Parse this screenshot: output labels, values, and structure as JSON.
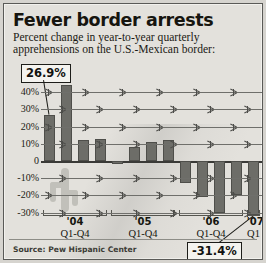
{
  "graphic": {
    "title": "Fewer border arrests",
    "subtitle": "Percent change in year-to-year quarterly apprehensions on the U.S.-Mexican border:",
    "source": "Source: Pew Hispanic Center"
  },
  "callouts": [
    {
      "id": "high",
      "label": "26.9%",
      "points_to_bar": 0
    },
    {
      "id": "low",
      "label": "-31.4%",
      "points_to_bar": 12
    }
  ],
  "chart_data": {
    "type": "bar",
    "title": "Fewer border arrests",
    "subtitle": "Percent change in year-to-year quarterly apprehensions on the U.S.-Mexican border:",
    "xlabel": "",
    "ylabel": "",
    "ylim": [
      -35,
      45
    ],
    "grid": true,
    "legend": "none",
    "yticks": [
      40,
      30,
      20,
      10,
      0,
      -10,
      -20,
      -30
    ],
    "ytick_labels": [
      "40%",
      "30%",
      "20%",
      "10%",
      "0",
      "-10%",
      "-20%",
      "-30%"
    ],
    "categories": [
      "'04 Q1",
      "'04 Q2",
      "'04 Q3",
      "'04 Q4",
      "'05 Q1",
      "'05 Q2",
      "'05 Q3",
      "'05 Q4",
      "'06 Q1",
      "'06 Q2",
      "'06 Q3",
      "'06 Q4",
      "'07 Q1"
    ],
    "values": [
      26.9,
      44.0,
      12.0,
      13.0,
      -1.5,
      8.0,
      11.0,
      12.5,
      -13.0,
      -21.0,
      -30.5,
      -19.5,
      -31.4
    ],
    "series": [
      {
        "name": "Percent change",
        "values": [
          26.9,
          44.0,
          12.0,
          13.0,
          -1.5,
          8.0,
          11.0,
          12.5,
          -13.0,
          -21.0,
          -30.5,
          -19.5,
          -31.4
        ]
      }
    ],
    "annotations": [
      {
        "text": "26.9%",
        "bar_index": 0
      },
      {
        "text": "-31.4%",
        "bar_index": 12
      }
    ],
    "groups": [
      {
        "year": "'04",
        "quarters": "Q1-Q4",
        "bars": [
          0,
          1,
          2,
          3
        ]
      },
      {
        "year": "'05",
        "quarters": "Q1-Q4",
        "bars": [
          4,
          5,
          6,
          7
        ]
      },
      {
        "year": "'06",
        "quarters": "Q1-Q4",
        "bars": [
          8,
          9,
          10,
          11
        ]
      },
      {
        "year": "'07",
        "quarters": "Q1",
        "bars": [
          12
        ]
      }
    ],
    "colors": {
      "bar": "#6d6d68",
      "bar_edge": "#4e4e4a",
      "background": "#e3e1dc",
      "grid": "#6f6f6b"
    }
  }
}
